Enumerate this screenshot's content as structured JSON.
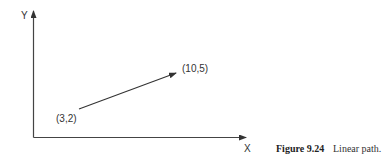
{
  "diagram": {
    "axes": {
      "y_label": "Y",
      "x_label": "X"
    },
    "path": {
      "start_label": "(3,2)",
      "end_label": "(10,5)",
      "start": [
        3,
        2
      ],
      "end": [
        10,
        5
      ]
    },
    "caption": {
      "number": "Figure 9.24",
      "text": "Linear path."
    },
    "colors": {
      "line": "#333333",
      "background": "#ffffff"
    }
  }
}
